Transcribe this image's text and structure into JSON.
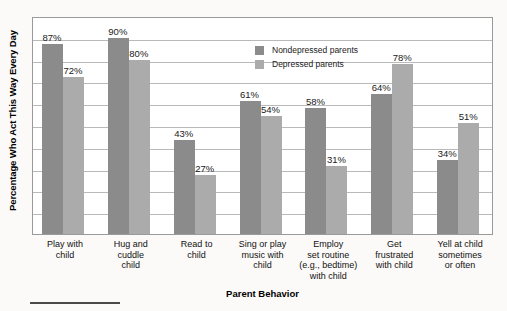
{
  "chart_data": {
    "type": "bar",
    "title": "",
    "xlabel": "Parent Behavior",
    "ylabel": "Percentage Who Act This Way Every Day",
    "ylim": [
      0,
      100
    ],
    "grid": true,
    "grid_interval": 10,
    "legend_position": "top-center",
    "value_suffix": "%",
    "categories": [
      "Play with\nchild",
      "Hug and\ncuddle\nchild",
      "Read to\nchild",
      "Sing or play\nmusic with\nchild",
      "Employ\nset routine\n(e.g., bedtime)\nwith child",
      "Get\nfrustrated\nwith child",
      "Yell at child\nsometimes\nor often"
    ],
    "series": [
      {
        "name": "Nondepressed parents",
        "color": "#8b8b8b",
        "values": [
          87,
          90,
          43,
          61,
          58,
          64,
          34
        ],
        "labels": [
          "87%",
          "90%",
          "43%",
          "61%",
          "58%",
          "64%",
          "34%"
        ]
      },
      {
        "name": "Depressed parents",
        "color": "#ababab",
        "values": [
          72,
          80,
          27,
          54,
          31,
          78,
          51
        ],
        "labels": [
          "72%",
          "80%",
          "27%",
          "54%",
          "31%",
          "78%",
          "51%"
        ]
      }
    ]
  }
}
